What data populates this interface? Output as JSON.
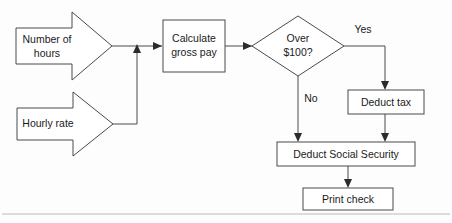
{
  "diagram": {
    "colors": {
      "shape_stroke": "#4a4a4a",
      "shape_fill": "#ffffff",
      "text": "#1a1a1a",
      "connector": "#4a4a4a",
      "arrow_head": "#2b2b2b",
      "frame": "#b9b9b9",
      "background": "#fdfdfd"
    },
    "nodes": {
      "input_hours": {
        "shape": "arrow-block",
        "label_line1": "Number of",
        "label_line2": "hours"
      },
      "input_rate": {
        "shape": "arrow-block",
        "label_line1": "Hourly rate",
        "label_line2": ""
      },
      "calculate_gross_pay": {
        "shape": "process",
        "label_line1": "Calculate",
        "label_line2": "gross pay"
      },
      "decision_over_100": {
        "shape": "decision",
        "label_line1": "Over",
        "label_line2": "$100?"
      },
      "deduct_tax": {
        "shape": "process",
        "label_line1": "Deduct tax",
        "label_line2": ""
      },
      "deduct_social_security": {
        "shape": "process",
        "label_line1": "Deduct Social Security",
        "label_line2": ""
      },
      "print_check": {
        "shape": "process",
        "label_line1": "Print check",
        "label_line2": ""
      }
    },
    "edge_labels": {
      "yes": "Yes",
      "no": "No"
    }
  }
}
